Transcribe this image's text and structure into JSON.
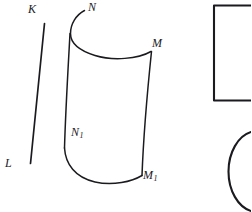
{
  "figure": {
    "background_color": "#ffffff",
    "ink_color": "#1b1b1f",
    "width": 251,
    "height": 212,
    "labels": [
      {
        "id": "K",
        "text": "K",
        "base": "K",
        "subscript": "",
        "x": 28,
        "y": 3
      },
      {
        "id": "N",
        "text": "N",
        "base": "N",
        "subscript": "",
        "x": 88,
        "y": 1
      },
      {
        "id": "M",
        "text": "M",
        "base": "M",
        "subscript": "",
        "x": 152,
        "y": 37
      },
      {
        "id": "N1",
        "text": "N1",
        "base": "N",
        "subscript": "1",
        "x": 71,
        "y": 126
      },
      {
        "id": "L",
        "text": "L",
        "base": "L",
        "subscript": "",
        "x": 5,
        "y": 157
      },
      {
        "id": "M1",
        "text": "M1",
        "base": "M",
        "subscript": "1",
        "x": 143,
        "y": 169
      }
    ],
    "shapes": [
      {
        "id": "segment-kl",
        "kind": "line",
        "description": "straight slanted segment from K to L"
      },
      {
        "id": "surface-left-edge",
        "kind": "curve",
        "description": "left generator of curved surface, N down to N1 region"
      },
      {
        "id": "surface-top-arc",
        "kind": "curve",
        "description": "top elliptical arc from N curling over to M"
      },
      {
        "id": "surface-right-edge",
        "kind": "curve",
        "description": "right generator of curved surface, M down to M1"
      },
      {
        "id": "surface-bottom-arc",
        "kind": "curve",
        "description": "bottom elliptical arc from lower-left to M1"
      },
      {
        "id": "rectangle-partial",
        "kind": "rectangle",
        "description": "partial rectangle outline clipped by right image edge"
      },
      {
        "id": "circle-partial",
        "kind": "circle",
        "description": "partial circle arc clipped by right image edge"
      }
    ]
  }
}
